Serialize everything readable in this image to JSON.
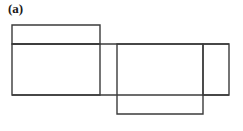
{
  "figure": {
    "panel_label": "(a)",
    "caption": "",
    "background_color": "#ffffff",
    "line_color": "#3b3b3b",
    "line_width": 1.4,
    "canvas": {
      "width": 243,
      "height": 131
    }
  },
  "chart_data": {
    "type": "diagram",
    "title": "(a)",
    "units": "pixels",
    "xlabel": "",
    "ylabel": "",
    "xlim": [
      0,
      243
    ],
    "ylim": [
      0,
      131
    ],
    "grid": false,
    "legend": null,
    "shapes": [
      {
        "name": "top-left-rectangle",
        "kind": "rectangle",
        "x": 12,
        "y": 25,
        "width": 88,
        "height": 19,
        "x2": 100,
        "y2": 44,
        "fill": "none",
        "stroke": "#3b3b3b"
      },
      {
        "name": "large-left-rectangle",
        "kind": "rectangle",
        "x": 12,
        "y": 44,
        "width": 88,
        "height": 51,
        "x2": 100,
        "y2": 95,
        "fill": "none",
        "stroke": "#3b3b3b"
      },
      {
        "name": "center-rectangle",
        "kind": "rectangle",
        "x": 117,
        "y": 44,
        "width": 86,
        "height": 70,
        "x2": 203,
        "y2": 114,
        "fill": "none",
        "stroke": "#3b3b3b"
      },
      {
        "name": "right-rectangle",
        "kind": "rectangle",
        "x": 203,
        "y": 44,
        "width": 26,
        "height": 51,
        "x2": 229,
        "y2": 95,
        "fill": "none",
        "stroke": "#3b3b3b"
      }
    ],
    "lines": [
      {
        "name": "upper-horizontal-seam",
        "x1": 12,
        "y1": 44,
        "x2": 229,
        "y2": 44,
        "stroke": "#3b3b3b"
      },
      {
        "name": "lower-horizontal-seam",
        "x1": 12,
        "y1": 95,
        "x2": 229,
        "y2": 95,
        "stroke": "#3b3b3b"
      }
    ]
  }
}
